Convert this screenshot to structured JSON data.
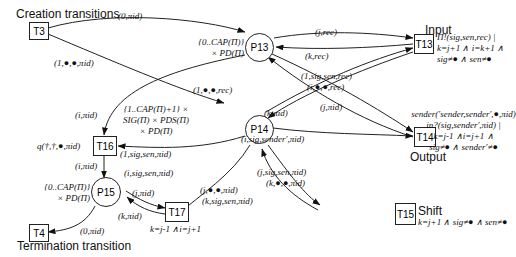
{
  "headings": {
    "creation": "Creation transitions",
    "termination": "Termination transition",
    "input": "Input",
    "output": "Output",
    "shift": "Shift"
  },
  "places": {
    "p13": {
      "label": "P13",
      "type": [
        "{0..CAP(Π)}",
        "× PD(Π)"
      ]
    },
    "p14": {
      "label": "P14",
      "type": [
        "{1..CAP(Π)+1} ×",
        "SIG(Π) × PDS(Π)",
        "× PD(Π)"
      ]
    },
    "p15": {
      "label": "P15",
      "type": [
        "{0..CAP(Π)}",
        "× PD(Π)"
      ]
    }
  },
  "transitions": {
    "t3": {
      "label": "T3"
    },
    "t4": {
      "label": "T4"
    },
    "t13": {
      "label": "T13",
      "guard": [
        "Π!(sig,sen,rec) |",
        "k=j+1 ∧ i=k+1 ∧",
        "sig≠● ∧ sen≠●"
      ]
    },
    "t14": {
      "label": "T14",
      "guard": [
        "sender('sender,sender',●,πid)",
        "in?(sig,sender',πid) |",
        "k=j-1  ∧i=j+1  ∧",
        "sig≠● ∧ sender'≠●"
      ]
    },
    "t15": {
      "label": "T15",
      "guard": "k=j+1 ∧ sig≠● ∧ sen≠●"
    },
    "t16": {
      "label": "T16",
      "guard": "q(†,†,●,πid)"
    },
    "t17": {
      "label": "T17",
      "guard": "k=j-1  ∧i=j+1"
    }
  },
  "arcs": {
    "t3_p13": "(0,πid)",
    "t3_p14": "(1,●,●,πid)",
    "p13_t13": "(j,rec)",
    "t13_p13": "(k,rec)",
    "p14_t13": "(1,sig,sen,rec)",
    "p14_t13b": "(i,●,●,rec)",
    "t13_p14": "(1,●,●,rec)",
    "p13_t14": "(j,πid)",
    "t14_p13": "(k,πid)",
    "p14_t14": "(i,sig,sender',πid)",
    "p13_t16": "(i,πid)",
    "p14_t16": "(1,sig,sen,πid)",
    "t16_p15": "(i,πid)",
    "p14_t17": "(i,sig,sen,πid)",
    "p15_t17": "(j,πid)",
    "t17_p15": "(k,πid)",
    "p14_t15": [
      "(j,sig,sen,πid)",
      "(k,●,●,πid)"
    ],
    "t15_p14": [
      "(j,●,●,πid)",
      "(k,sig,sen,πid)"
    ],
    "p15_t4": "(0,πid)"
  }
}
